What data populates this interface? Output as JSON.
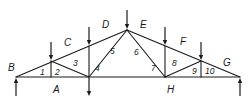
{
  "diagram": {
    "type": "roof truss (Bow's notation)",
    "stroke_color": "#1a1a1a",
    "background": "#ffffff",
    "region_labels": [
      {
        "text": "A",
        "x": 53,
        "y": 93
      },
      {
        "text": "B",
        "x": 8,
        "y": 71
      },
      {
        "text": "C",
        "x": 64,
        "y": 46
      },
      {
        "text": "D",
        "x": 102,
        "y": 28
      },
      {
        "text": "E",
        "x": 140,
        "y": 28
      },
      {
        "text": "F",
        "x": 180,
        "y": 45
      },
      {
        "text": "G",
        "x": 223,
        "y": 66
      },
      {
        "text": "H",
        "x": 167,
        "y": 93
      }
    ],
    "panel_labels": [
      {
        "text": "1",
        "x": 40,
        "y": 75
      },
      {
        "text": "2",
        "x": 55,
        "y": 75
      },
      {
        "text": "3",
        "x": 73,
        "y": 66
      },
      {
        "text": "4",
        "x": 95,
        "y": 71
      },
      {
        "text": "5",
        "x": 110,
        "y": 54
      },
      {
        "text": "6",
        "x": 134,
        "y": 55
      },
      {
        "text": "7",
        "x": 151,
        "y": 71
      },
      {
        "text": "8",
        "x": 172,
        "y": 66
      },
      {
        "text": "9",
        "x": 192,
        "y": 74
      },
      {
        "text": "10",
        "x": 205,
        "y": 74
      }
    ],
    "nodes": {
      "left_support": [
        16,
        77
      ],
      "top_1": [
        51,
        61
      ],
      "top_2": [
        89,
        46
      ],
      "apex": [
        127,
        30
      ],
      "top_3": [
        165,
        46
      ],
      "top_4": [
        201,
        61
      ],
      "right_support": [
        240,
        77
      ],
      "bottom_1": [
        51,
        77
      ],
      "bottom_2": [
        89,
        77
      ],
      "bottom_3": [
        165,
        77
      ],
      "bottom_4": [
        201,
        77
      ]
    },
    "members": [
      [
        "left_support",
        "apex"
      ],
      [
        "apex",
        "right_support"
      ],
      [
        "left_support",
        "right_support"
      ],
      [
        "top_1",
        "bottom_1"
      ],
      [
        "top_1",
        "bottom_2"
      ],
      [
        "top_2",
        "bottom_2"
      ],
      [
        "bottom_2",
        "apex"
      ],
      [
        "apex",
        "bottom_3"
      ],
      [
        "top_3",
        "bottom_3"
      ],
      [
        "bottom_3",
        "top_4"
      ],
      [
        "top_4",
        "bottom_4"
      ]
    ],
    "loads_down": [
      {
        "at": "top_1",
        "from_y": 42
      },
      {
        "at": "top_2",
        "from_y": 27
      },
      {
        "at": "apex",
        "from_y": 10
      },
      {
        "at": "top_3",
        "from_y": 27
      },
      {
        "at": "top_4",
        "from_y": 42
      },
      {
        "at": "bottom_2",
        "to_y": 96
      }
    ],
    "reactions_up": [
      {
        "at": "left_support",
        "from_y": 96
      },
      {
        "at": "right_support",
        "from_y": 96
      }
    ]
  }
}
